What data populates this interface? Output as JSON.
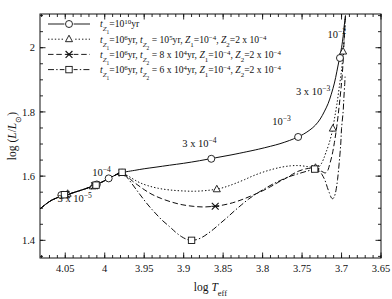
{
  "chart_data": {
    "type": "line",
    "title": "",
    "xlabel": "log T_eff",
    "ylabel": "log (L/L_sun)",
    "xlim": [
      4.082,
      3.65
    ],
    "ylim": [
      1.345,
      2.105
    ],
    "x_reversed": true,
    "grid": false,
    "x_ticks": [
      "4.05",
      "4",
      "3.95",
      "3.9",
      "3.85",
      "3.8",
      "3.75",
      "3.7",
      "3.65"
    ],
    "x_tick_values": [
      4.05,
      4.0,
      3.95,
      3.9,
      3.85,
      3.8,
      3.75,
      3.7,
      3.65
    ],
    "x_minor_step": 0.01,
    "y_ticks": [
      "1.4",
      "1.6",
      "1.8",
      "2"
    ],
    "y_tick_values": [
      1.4,
      1.6,
      1.8,
      2.0
    ],
    "y_minor_step": 0.05,
    "legend_position": "upper-left",
    "line_color": "#000000",
    "series": [
      {
        "name": "curve-1",
        "label_plain": "t_Z1 = 10^10 yr",
        "dash": "none",
        "marker": "circle",
        "points": [
          [
            4.082,
            1.498
          ],
          [
            4.075,
            1.512
          ],
          [
            4.068,
            1.524
          ],
          [
            4.06,
            1.533
          ],
          [
            4.052,
            1.54
          ],
          [
            4.043,
            1.546
          ],
          [
            4.034,
            1.553
          ],
          [
            4.024,
            1.561
          ],
          [
            4.014,
            1.57
          ],
          [
            4.004,
            1.581
          ],
          [
            3.996,
            1.591
          ],
          [
            3.99,
            1.599
          ],
          [
            3.984,
            1.606
          ],
          [
            3.978,
            1.611
          ],
          [
            3.972,
            1.614
          ],
          [
            3.962,
            1.618
          ],
          [
            3.95,
            1.623
          ],
          [
            3.935,
            1.628
          ],
          [
            3.918,
            1.634
          ],
          [
            3.9,
            1.64
          ],
          [
            3.88,
            1.648
          ],
          [
            3.86,
            1.657
          ],
          [
            3.84,
            1.666
          ],
          [
            3.82,
            1.676
          ],
          [
            3.805,
            1.684
          ],
          [
            3.79,
            1.693
          ],
          [
            3.778,
            1.701
          ],
          [
            3.766,
            1.711
          ],
          [
            3.756,
            1.721
          ],
          [
            3.748,
            1.731
          ],
          [
            3.74,
            1.744
          ],
          [
            3.733,
            1.759
          ],
          [
            3.727,
            1.778
          ],
          [
            3.722,
            1.8
          ],
          [
            3.717,
            1.826
          ],
          [
            3.713,
            1.855
          ],
          [
            3.709,
            1.89
          ],
          [
            3.706,
            1.925
          ],
          [
            3.703,
            1.962
          ],
          [
            3.7,
            2.0
          ],
          [
            3.698,
            2.035
          ],
          [
            3.697,
            2.06
          ],
          [
            3.696,
            2.08
          ],
          [
            3.695,
            2.1
          ]
        ],
        "markers": [
          [
            4.055,
            1.541
          ],
          [
            4.01,
            1.574
          ],
          [
            3.995,
            1.593
          ],
          [
            3.865,
            1.654
          ],
          [
            3.755,
            1.722
          ],
          [
            3.702,
            1.968
          ]
        ]
      },
      {
        "name": "curve-2",
        "label_plain": "t_Z1 = 10^6 yr, t_Z2 = 10^5 yr, Z_1 = 10^-4, Z_2 = 2 x 10^-4",
        "dash": "dotted",
        "marker": "triangle",
        "points": [
          [
            4.082,
            1.498
          ],
          [
            4.075,
            1.512
          ],
          [
            4.068,
            1.524
          ],
          [
            4.06,
            1.533
          ],
          [
            4.052,
            1.54
          ],
          [
            4.043,
            1.546
          ],
          [
            4.034,
            1.553
          ],
          [
            4.024,
            1.561
          ],
          [
            4.014,
            1.57
          ],
          [
            4.004,
            1.581
          ],
          [
            3.996,
            1.591
          ],
          [
            3.99,
            1.599
          ],
          [
            3.985,
            1.605
          ],
          [
            3.981,
            1.609
          ],
          [
            3.978,
            1.61
          ],
          [
            3.975,
            1.608
          ],
          [
            3.972,
            1.603
          ],
          [
            3.968,
            1.597
          ],
          [
            3.962,
            1.588
          ],
          [
            3.955,
            1.579
          ],
          [
            3.945,
            1.57
          ],
          [
            3.932,
            1.562
          ],
          [
            3.918,
            1.557
          ],
          [
            3.902,
            1.554
          ],
          [
            3.885,
            1.553
          ],
          [
            3.868,
            1.556
          ],
          [
            3.855,
            1.561
          ],
          [
            3.845,
            1.568
          ],
          [
            3.835,
            1.577
          ],
          [
            3.823,
            1.589
          ],
          [
            3.812,
            1.601
          ],
          [
            3.8,
            1.612
          ],
          [
            3.788,
            1.621
          ],
          [
            3.776,
            1.628
          ],
          [
            3.765,
            1.632
          ],
          [
            3.757,
            1.633
          ],
          [
            3.75,
            1.632
          ],
          [
            3.744,
            1.63
          ],
          [
            3.739,
            1.628
          ],
          [
            3.735,
            1.626
          ],
          [
            3.732,
            1.625
          ],
          [
            3.729,
            1.628
          ],
          [
            3.726,
            1.637
          ],
          [
            3.723,
            1.652
          ],
          [
            3.72,
            1.672
          ],
          [
            3.716,
            1.7
          ],
          [
            3.712,
            1.737
          ],
          [
            3.709,
            1.778
          ],
          [
            3.706,
            1.822
          ],
          [
            3.703,
            1.875
          ],
          [
            3.7,
            1.93
          ],
          [
            3.698,
            1.98
          ],
          [
            3.697,
            2.02
          ],
          [
            3.696,
            2.06
          ],
          [
            3.695,
            2.1
          ]
        ],
        "markers": [
          [
            4.047,
            1.545
          ],
          [
            4.015,
            1.568
          ],
          [
            3.978,
            1.61
          ],
          [
            3.858,
            1.559
          ],
          [
            3.733,
            1.626
          ],
          [
            3.711,
            1.748
          ],
          [
            3.698,
            1.988
          ]
        ]
      },
      {
        "name": "curve-3",
        "label_plain": "t_Z1 = 10^6 yr, t_Z2 = 8 x 10^4 yr, Z_1 = 10^-4, Z_2 = 2 x 10^-4",
        "dash": "dashed",
        "marker": "cross",
        "points": [
          [
            4.082,
            1.498
          ],
          [
            4.075,
            1.512
          ],
          [
            4.068,
            1.524
          ],
          [
            4.06,
            1.533
          ],
          [
            4.052,
            1.54
          ],
          [
            4.043,
            1.546
          ],
          [
            4.034,
            1.553
          ],
          [
            4.024,
            1.561
          ],
          [
            4.014,
            1.57
          ],
          [
            4.004,
            1.581
          ],
          [
            3.996,
            1.591
          ],
          [
            3.99,
            1.599
          ],
          [
            3.985,
            1.605
          ],
          [
            3.981,
            1.609
          ],
          [
            3.978,
            1.61
          ],
          [
            3.974,
            1.605
          ],
          [
            3.97,
            1.596
          ],
          [
            3.965,
            1.585
          ],
          [
            3.958,
            1.572
          ],
          [
            3.95,
            1.558
          ],
          [
            3.94,
            1.543
          ],
          [
            3.928,
            1.53
          ],
          [
            3.915,
            1.519
          ],
          [
            3.902,
            1.511
          ],
          [
            3.888,
            1.506
          ],
          [
            3.875,
            1.504
          ],
          [
            3.862,
            1.506
          ],
          [
            3.85,
            1.51
          ],
          [
            3.838,
            1.517
          ],
          [
            3.826,
            1.527
          ],
          [
            3.814,
            1.539
          ],
          [
            3.802,
            1.552
          ],
          [
            3.79,
            1.567
          ],
          [
            3.78,
            1.581
          ],
          [
            3.77,
            1.594
          ],
          [
            3.762,
            1.606
          ],
          [
            3.755,
            1.615
          ],
          [
            3.748,
            1.621
          ],
          [
            3.742,
            1.624
          ],
          [
            3.737,
            1.625
          ],
          [
            3.733,
            1.623
          ],
          [
            3.729,
            1.62
          ],
          [
            3.726,
            1.616
          ],
          [
            3.723,
            1.612
          ],
          [
            3.721,
            1.61
          ],
          [
            3.719,
            1.612
          ],
          [
            3.717,
            1.62
          ],
          [
            3.715,
            1.637
          ],
          [
            3.712,
            1.665
          ],
          [
            3.709,
            1.705
          ],
          [
            3.706,
            1.755
          ],
          [
            3.703,
            1.818
          ],
          [
            3.7,
            1.89
          ],
          [
            3.698,
            1.955
          ],
          [
            3.697,
            2.01
          ],
          [
            3.696,
            2.055
          ],
          [
            3.695,
            2.1
          ]
        ],
        "markers": [
          [
            4.049,
            1.543
          ],
          [
            4.013,
            1.57
          ],
          [
            3.978,
            1.61
          ],
          [
            3.86,
            1.506
          ],
          [
            3.733,
            1.623
          ]
        ]
      },
      {
        "name": "curve-4",
        "label_plain": "t_Z1 = 10^6 yr, t_Z2 = 6 x 10^4 yr, Z_1 = 10^-4, Z_2 = 2 x 10^-4",
        "dash": "dashdot",
        "marker": "square",
        "points": [
          [
            4.082,
            1.498
          ],
          [
            4.075,
            1.512
          ],
          [
            4.068,
            1.524
          ],
          [
            4.06,
            1.533
          ],
          [
            4.052,
            1.54
          ],
          [
            4.043,
            1.546
          ],
          [
            4.034,
            1.553
          ],
          [
            4.024,
            1.561
          ],
          [
            4.014,
            1.57
          ],
          [
            4.004,
            1.581
          ],
          [
            3.996,
            1.591
          ],
          [
            3.99,
            1.599
          ],
          [
            3.985,
            1.606
          ],
          [
            3.981,
            1.61
          ],
          [
            3.978,
            1.612
          ],
          [
            3.975,
            1.606
          ],
          [
            3.971,
            1.594
          ],
          [
            3.966,
            1.578
          ],
          [
            3.96,
            1.558
          ],
          [
            3.953,
            1.535
          ],
          [
            3.945,
            1.51
          ],
          [
            3.936,
            1.485
          ],
          [
            3.927,
            1.462
          ],
          [
            3.918,
            1.443
          ],
          [
            3.91,
            1.425
          ],
          [
            3.903,
            1.412
          ],
          [
            3.896,
            1.403
          ],
          [
            3.89,
            1.4
          ],
          [
            3.884,
            1.402
          ],
          [
            3.877,
            1.409
          ],
          [
            3.87,
            1.42
          ],
          [
            3.862,
            1.435
          ],
          [
            3.854,
            1.452
          ],
          [
            3.845,
            1.471
          ],
          [
            3.836,
            1.491
          ],
          [
            3.827,
            1.51
          ],
          [
            3.818,
            1.528
          ],
          [
            3.808,
            1.545
          ],
          [
            3.798,
            1.56
          ],
          [
            3.788,
            1.574
          ],
          [
            3.778,
            1.586
          ],
          [
            3.768,
            1.597
          ],
          [
            3.758,
            1.605
          ],
          [
            3.75,
            1.611
          ],
          [
            3.743,
            1.616
          ],
          [
            3.737,
            1.62
          ],
          [
            3.733,
            1.622
          ],
          [
            3.729,
            1.618
          ],
          [
            3.725,
            1.606
          ],
          [
            3.721,
            1.587
          ],
          [
            3.718,
            1.565
          ],
          [
            3.715,
            1.545
          ],
          [
            3.713,
            1.533
          ],
          [
            3.711,
            1.53
          ],
          [
            3.709,
            1.537
          ],
          [
            3.707,
            1.556
          ],
          [
            3.705,
            1.59
          ],
          [
            3.703,
            1.64
          ],
          [
            3.701,
            1.7
          ],
          [
            3.7,
            1.748
          ],
          [
            3.698,
            1.8
          ],
          [
            3.697,
            1.845
          ],
          [
            3.696,
            1.885
          ],
          [
            3.6955,
            1.91
          ]
        ],
        "markers": [
          [
            4.051,
            1.542
          ],
          [
            4.011,
            1.572
          ],
          [
            3.978,
            1.612
          ],
          [
            3.89,
            1.4
          ],
          [
            3.734,
            1.622
          ]
        ]
      }
    ],
    "annotations": [
      {
        "text_plain": "3 x 10^-5",
        "x": 4.038,
        "y": 1.52
      },
      {
        "text_plain": "10^-4",
        "x": 4.004,
        "y": 1.6
      },
      {
        "text_plain": "3 x 10^-4",
        "x": 3.88,
        "y": 1.69
      },
      {
        "text_plain": "10^-3",
        "x": 3.776,
        "y": 1.76
      },
      {
        "text_plain": "3 x 10^-3",
        "x": 3.736,
        "y": 1.852
      },
      {
        "text_plain": "10^-2",
        "x": 3.706,
        "y": 2.03
      }
    ]
  },
  "legend": {
    "entries": [
      {
        "t1_sym": "t",
        "t1_sub": "Z",
        "t1_subsub": "1",
        "eq": "=",
        "t1_base": "10",
        "t1_exp": "10",
        "t1_unit": "yr",
        "rest": ""
      }
    ],
    "items": [
      {
        "tA_sub1": "Z",
        "tA_sub2": "1",
        "tA_base": "10",
        "tA_exp": "10",
        "tA_unit": "yr",
        "has_second": false,
        "has_metal": false,
        "tB_sub1": "",
        "tB_sub2": "",
        "tB_coef": "",
        "tB_base": "",
        "tB_exp": "",
        "tB_unit": "",
        "z1_coef": "",
        "z1_base": "",
        "z1_exp": "",
        "z2_coef": "",
        "z2_base": "",
        "z2_exp": ""
      },
      {
        "tA_sub1": "Z",
        "tA_sub2": "1",
        "tA_base": "10",
        "tA_exp": "6",
        "tA_unit": "yr",
        "has_second": true,
        "has_metal": true,
        "tB_sub1": "Z",
        "tB_sub2": "2",
        "tB_coef": "",
        "tB_base": "10",
        "tB_exp": "5",
        "tB_unit": "yr",
        "z1_coef": "",
        "z1_base": "10",
        "z1_exp": "-4",
        "z2_coef": "2 x ",
        "z2_base": "10",
        "z2_exp": "-4"
      },
      {
        "tA_sub1": "Z",
        "tA_sub2": "1",
        "tA_base": "10",
        "tA_exp": "6",
        "tA_unit": "yr",
        "has_second": true,
        "has_metal": true,
        "tB_sub1": "Z",
        "tB_sub2": "2",
        "tB_coef": "8 x ",
        "tB_base": "10",
        "tB_exp": "4",
        "tB_unit": "yr",
        "z1_coef": "",
        "z1_base": "10",
        "z1_exp": "-4",
        "z2_coef": "2 x ",
        "z2_base": "10",
        "z2_exp": "-4"
      },
      {
        "tA_sub1": "Z",
        "tA_sub2": "1",
        "tA_base": "10",
        "tA_exp": "6",
        "tA_unit": "yr",
        "has_second": true,
        "has_metal": true,
        "tB_sub1": "Z",
        "tB_sub2": "2",
        "tB_coef": "6 x ",
        "tB_base": "10",
        "tB_exp": "4",
        "tB_unit": "yr",
        "z1_coef": "",
        "z1_base": "10",
        "z1_exp": "-4",
        "z2_coef": "2 x ",
        "z2_base": "10",
        "z2_exp": "-4"
      }
    ],
    "t_symbol": "t",
    "Z_symbol": "Z",
    "equals": "=",
    "comma": ", "
  },
  "axes": {
    "xlabel_main": "log ",
    "xlabel_italic": "T",
    "xlabel_sub": "eff",
    "ylabel_main": "log (",
    "ylabel_italic_L": "L",
    "ylabel_slash": "/",
    "ylabel_italic_L2": "L",
    "ylabel_sun": "⊙",
    "ylabel_close": ")"
  }
}
